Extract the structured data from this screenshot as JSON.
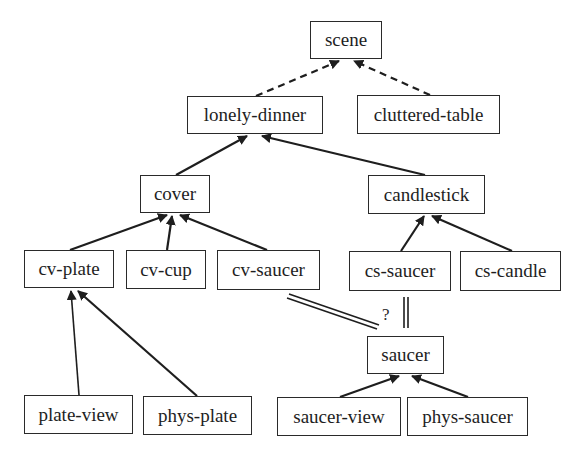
{
  "diagram": {
    "nodes": {
      "scene": {
        "label": "scene",
        "x": 310,
        "y": 21,
        "w": 72,
        "h": 38
      },
      "lonely_dinner": {
        "label": "lonely-dinner",
        "x": 187,
        "y": 96,
        "w": 136,
        "h": 38
      },
      "cluttered_table": {
        "label": "cluttered-table",
        "x": 357,
        "y": 95,
        "w": 143,
        "h": 39
      },
      "cover": {
        "label": "cover",
        "x": 140,
        "y": 175,
        "w": 70,
        "h": 38
      },
      "candlestick": {
        "label": "candlestick",
        "x": 368,
        "y": 175,
        "w": 117,
        "h": 39
      },
      "cv_plate": {
        "label": "cv-plate",
        "x": 24,
        "y": 250,
        "w": 90,
        "h": 38
      },
      "cv_cup": {
        "label": "cv-cup",
        "x": 126,
        "y": 250,
        "w": 80,
        "h": 39
      },
      "cv_saucer": {
        "label": "cv-saucer",
        "x": 217,
        "y": 250,
        "w": 103,
        "h": 40
      },
      "cs_saucer": {
        "label": "cs-saucer",
        "x": 349,
        "y": 251,
        "w": 102,
        "h": 40
      },
      "cs_candle": {
        "label": "cs-candle",
        "x": 460,
        "y": 251,
        "w": 101,
        "h": 40
      },
      "saucer": {
        "label": "saucer",
        "x": 367,
        "y": 336,
        "w": 77,
        "h": 38
      },
      "plate_view": {
        "label": "plate-view",
        "x": 24,
        "y": 395,
        "w": 109,
        "h": 39
      },
      "phys_plate": {
        "label": "phys-plate",
        "x": 143,
        "y": 396,
        "w": 109,
        "h": 39
      },
      "saucer_view": {
        "label": "saucer-view",
        "x": 277,
        "y": 397,
        "w": 124,
        "h": 39
      },
      "phys_saucer": {
        "label": "phys-saucer",
        "x": 407,
        "y": 397,
        "w": 121,
        "h": 39
      }
    },
    "edges": [
      {
        "from": "lonely-dinner",
        "to": "scene",
        "style": "dashed-arrow"
      },
      {
        "from": "cluttered-table",
        "to": "scene",
        "style": "dashed-arrow"
      },
      {
        "from": "cover",
        "to": "lonely-dinner",
        "style": "solid-arrow"
      },
      {
        "from": "candlestick",
        "to": "lonely-dinner",
        "style": "solid-arrow"
      },
      {
        "from": "cv-plate",
        "to": "cover",
        "style": "solid-arrow"
      },
      {
        "from": "cv-cup",
        "to": "cover",
        "style": "solid-arrow"
      },
      {
        "from": "cv-saucer",
        "to": "cover",
        "style": "solid-arrow"
      },
      {
        "from": "cs-saucer",
        "to": "candlestick",
        "style": "solid-arrow"
      },
      {
        "from": "cs-candle",
        "to": "candlestick",
        "style": "solid-arrow"
      },
      {
        "from": "plate-view",
        "to": "cv-plate",
        "style": "solid-arrow"
      },
      {
        "from": "phys-plate",
        "to": "cv-plate",
        "style": "solid-arrow"
      },
      {
        "from": "saucer-view",
        "to": "saucer",
        "style": "solid-arrow"
      },
      {
        "from": "phys-saucer",
        "to": "saucer",
        "style": "solid-arrow"
      },
      {
        "from": "cv-saucer",
        "to": "saucer",
        "style": "double-line",
        "annotation": "?"
      },
      {
        "from": "cs-saucer",
        "to": "saucer",
        "style": "double-line"
      }
    ],
    "annotations": {
      "question_mark": "?"
    },
    "colors": {
      "stroke": "#1e1e1e",
      "box_border": "#2a2a2a",
      "background": "#ffffff"
    }
  }
}
